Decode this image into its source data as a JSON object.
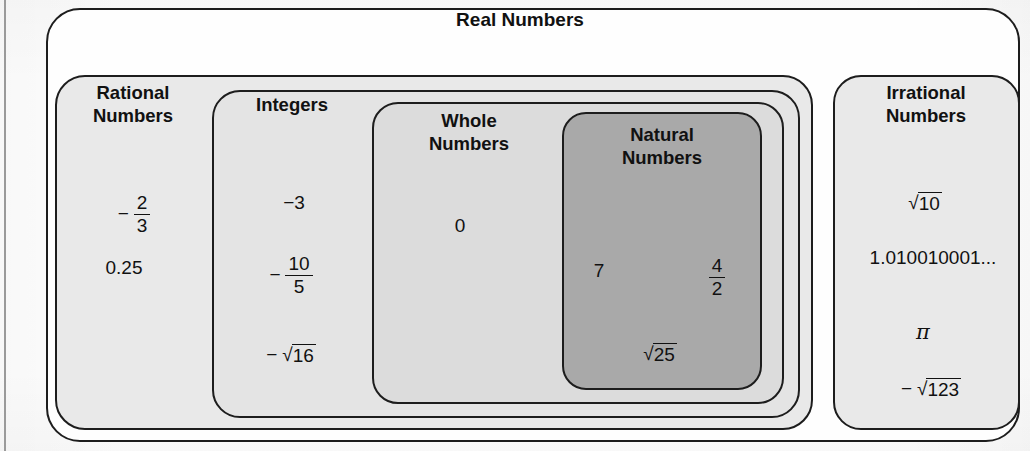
{
  "diagram": {
    "title": "Real Numbers",
    "bleed_through_artifact": "Real Numbers",
    "sets": {
      "real": {
        "label": "Real Numbers",
        "fill": "#fefefe"
      },
      "rational": {
        "label": "Rational\nNumbers",
        "fill": "#e9e9e9"
      },
      "integers": {
        "label": "Integers",
        "fill": "#e4e4e4"
      },
      "whole": {
        "label": "Whole\nNumbers",
        "fill": "#dcdcdc"
      },
      "natural": {
        "label": "Natural\nNumbers",
        "fill": "#a9a9a9"
      },
      "irrational": {
        "label": "Irrational\nNumbers",
        "fill": "#e9e9e9"
      }
    },
    "members": {
      "rational": {
        "fraction_neg_two_thirds": {
          "sign": "−",
          "numerator": "2",
          "denominator": "3"
        },
        "decimal": "0.25"
      },
      "integers": {
        "neg_three": "−3",
        "fraction_neg_ten_fifths": {
          "sign": "−",
          "numerator": "10",
          "denominator": "5"
        },
        "neg_sqrt_sixteen": {
          "sign": "−",
          "radical": "√",
          "radicand": "16"
        }
      },
      "whole": {
        "zero": "0"
      },
      "natural": {
        "seven": "7",
        "fraction_four_halves": {
          "numerator": "4",
          "denominator": "2"
        },
        "sqrt_twentyfive": {
          "radical": "√",
          "radicand": "25"
        }
      },
      "irrational": {
        "sqrt_ten": {
          "radical": "√",
          "radicand": "10"
        },
        "nonrepeating_decimal": "1.010010001...",
        "pi": "π",
        "neg_sqrt_onetwentythree": {
          "sign": "−",
          "radical": "√",
          "radicand": "123"
        }
      }
    },
    "colors": {
      "outline": "#1d1d1d",
      "text": "#111111",
      "page_rule": "#9a9a9a"
    }
  }
}
